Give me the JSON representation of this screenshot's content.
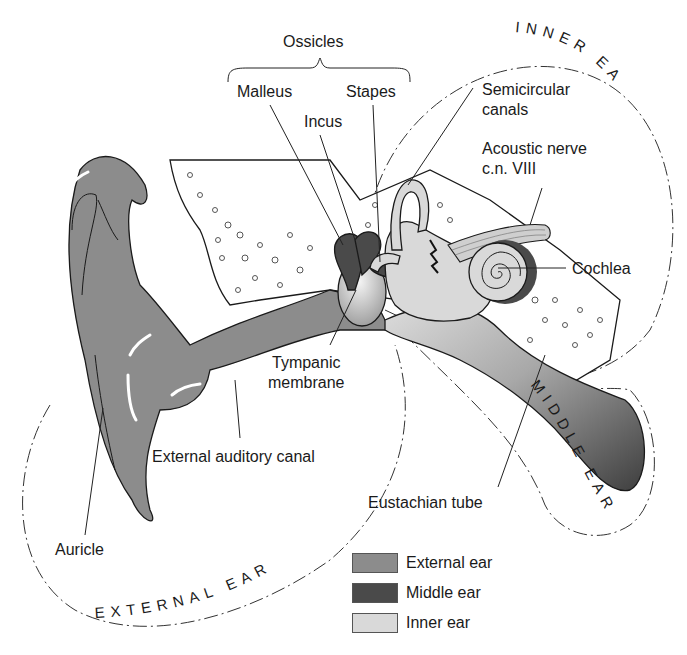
{
  "figure": {
    "regions": {
      "external": "EXTERNAL EAR",
      "middle": "MIDDLE EAR",
      "inner": "INNER EAR"
    },
    "group_labels": {
      "ossicles": "Ossicles"
    },
    "labels": {
      "malleus": "Malleus",
      "incus": "Incus",
      "stapes": "Stapes",
      "semicircular_1": "Semicircular",
      "semicircular_2": "canals",
      "acoustic_1": "Acoustic nerve",
      "acoustic_2": "c.n. VIII",
      "cochlea": "Cochlea",
      "tympanic_1": "Tympanic",
      "tympanic_2": "membrane",
      "external_canal": "External auditory canal",
      "eustachian": "Eustachian tube",
      "auricle": "Auricle"
    },
    "legend": [
      {
        "label": "External ear",
        "color": "#8c8c8c"
      },
      {
        "label": "Middle ear",
        "color": "#4a4a4a"
      },
      {
        "label": "Inner ear",
        "color": "#d9d9d9"
      }
    ],
    "colors": {
      "external": "#8c8c8c",
      "middle": "#4a4a4a",
      "inner": "#d9d9d9",
      "bone": "#ffffff"
    }
  }
}
